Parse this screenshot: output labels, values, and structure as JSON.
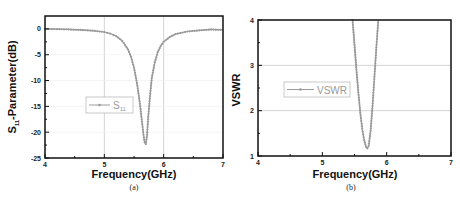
{
  "chart_data": [
    {
      "type": "line",
      "panel_label": "(a)",
      "title": "",
      "xlabel": "Frequency(GHz)",
      "ylabel": "S11-Parameter(dB)",
      "xlim": [
        4,
        7
      ],
      "ylim": [
        -25,
        2.5
      ],
      "xticks": [
        4,
        5,
        6,
        7
      ],
      "yticks": [
        0,
        -5,
        -10,
        -15,
        -20,
        -25
      ],
      "grid": "vertical at 5 and 6; horizontal faint",
      "legend": {
        "entries": [
          "S11"
        ],
        "position": "center-left"
      },
      "series": [
        {
          "name": "S11",
          "color": "#9a9a9a",
          "x": [
            4.0,
            4.2,
            4.4,
            4.6,
            4.8,
            5.0,
            5.1,
            5.2,
            5.3,
            5.4,
            5.45,
            5.5,
            5.55,
            5.6,
            5.63,
            5.66,
            5.68,
            5.7,
            5.72,
            5.74,
            5.77,
            5.8,
            5.85,
            5.9,
            5.95,
            6.0,
            6.1,
            6.2,
            6.4,
            6.6,
            6.8,
            7.0
          ],
          "y": [
            0,
            -0.05,
            -0.1,
            -0.2,
            -0.35,
            -0.6,
            -0.9,
            -1.4,
            -2.3,
            -4.0,
            -5.4,
            -7.5,
            -10.5,
            -14.5,
            -17.5,
            -20.5,
            -22.0,
            -22.3,
            -20.5,
            -17.0,
            -13.0,
            -9.5,
            -6.5,
            -4.5,
            -3.3,
            -2.5,
            -1.6,
            -1.0,
            -0.5,
            -0.3,
            -0.1,
            -0.2
          ]
        }
      ]
    },
    {
      "type": "line",
      "panel_label": "(b)",
      "title": "",
      "xlabel": "Frequency(GHz)",
      "ylabel": "VSWR",
      "xlim": [
        4,
        7
      ],
      "ylim": [
        1,
        4
      ],
      "xticks": [
        4,
        5,
        6,
        7
      ],
      "yticks": [
        1,
        2,
        3,
        4
      ],
      "grid": "horizontal at 2 and 3",
      "legend": {
        "entries": [
          "VSWR"
        ],
        "position": "center-left"
      },
      "series": [
        {
          "name": "VSWR",
          "color": "#9a9a9a",
          "x": [
            5.47,
            5.5,
            5.53,
            5.56,
            5.59,
            5.62,
            5.65,
            5.68,
            5.7,
            5.72,
            5.75,
            5.78,
            5.81,
            5.84,
            5.87
          ],
          "y": [
            4.0,
            3.45,
            2.9,
            2.4,
            1.95,
            1.6,
            1.35,
            1.2,
            1.17,
            1.22,
            1.55,
            2.1,
            2.75,
            3.4,
            4.0
          ]
        }
      ]
    }
  ],
  "panels": {
    "a": {
      "xlabel": "Frequency(GHz)",
      "ylabel_main": "S",
      "ylabel_sub": "11",
      "ylabel_rest": "-Parameter(dB)",
      "caption": "(a)",
      "legend_main": "S",
      "legend_sub": "11"
    },
    "b": {
      "xlabel": "Frequency(GHz)",
      "ylabel": "VSWR",
      "caption": "(b)",
      "legend": "VSWR"
    }
  }
}
